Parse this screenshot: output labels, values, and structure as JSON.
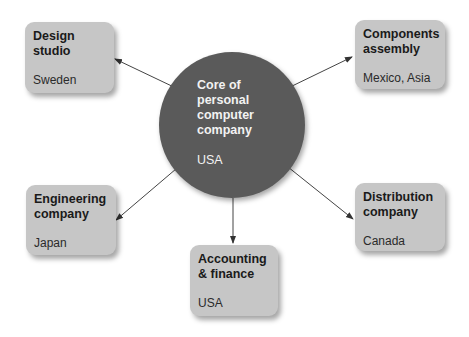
{
  "diagram": {
    "type": "hub-and-spoke",
    "center": {
      "title": "Core of\npersonal\ncomputer\ncompany",
      "location": "USA"
    },
    "nodes": [
      {
        "id": "design",
        "title": "Design\nstudio",
        "location": "Sweden"
      },
      {
        "id": "components",
        "title": "Components\nassembly",
        "location": "Mexico, Asia"
      },
      {
        "id": "engineering",
        "title": "Engineering\ncompany",
        "location": "Japan"
      },
      {
        "id": "accounting",
        "title": "Accounting\n& finance",
        "location": "USA"
      },
      {
        "id": "distribution",
        "title": "Distribution\ncompany",
        "location": "Canada"
      }
    ],
    "edges": [
      {
        "from": "center",
        "to": "design"
      },
      {
        "from": "center",
        "to": "components"
      },
      {
        "from": "center",
        "to": "engineering"
      },
      {
        "from": "center",
        "to": "accounting"
      },
      {
        "from": "center",
        "to": "distribution"
      }
    ],
    "colors": {
      "box": "#c6c6c6",
      "circle": "#5a5a5a",
      "arrow": "#333333"
    }
  }
}
